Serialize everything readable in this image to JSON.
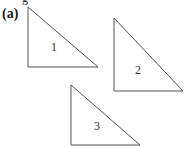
{
  "figure": {
    "panel_label": "(a)",
    "top_fragment": "g",
    "triangles": [
      {
        "label": "1",
        "points": "28,7 28,67 98,67",
        "label_pos": [
          51,
          40
        ]
      },
      {
        "label": "2",
        "points": "114,18 114,91 183,91",
        "label_pos": [
          135,
          63
        ]
      },
      {
        "label": "3",
        "points": "71,85 71,145 140,145",
        "label_pos": [
          94,
          119
        ]
      }
    ],
    "stroke_color": "#555555"
  }
}
